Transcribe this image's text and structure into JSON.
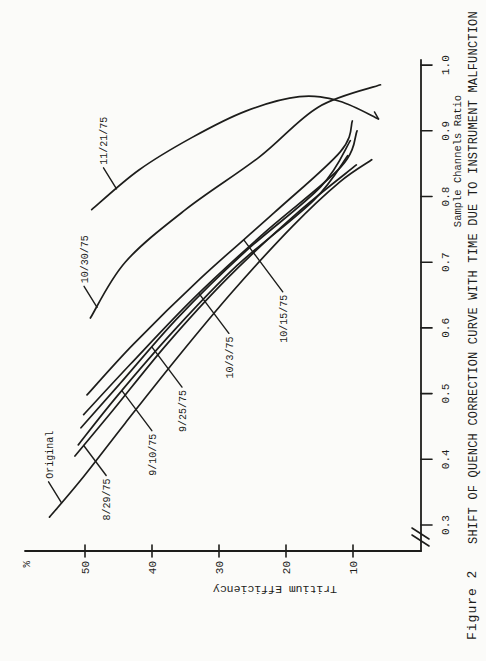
{
  "page": {
    "background": "#fbfbf9",
    "ink": "#1d1d1b"
  },
  "figure": {
    "caption": "Figure 2",
    "title": "SHIFT OF QUENCH CORRECTION CURVE WITH TIME DUE TO INSTRUMENT MALFUNCTION",
    "rotation": "chart printed landscape, rotated 90 degrees on portrait page"
  },
  "axes": {
    "x": {
      "label": "Sample Channels Ratio",
      "tick_values": [
        "0.3",
        "0.4",
        "0.5",
        "0.6",
        "0.7",
        "0.8",
        "0.9",
        "1.0"
      ],
      "range": [
        0.3,
        1.0
      ],
      "axis_break": true
    },
    "y": {
      "label": "Tritium Efficiency",
      "unit_label": "%",
      "tick_values": [
        "50",
        "40",
        "30",
        "20",
        "10"
      ],
      "range": [
        0,
        57
      ]
    }
  },
  "chart_data": {
    "type": "line",
    "title": "SHIFT OF QUENCH CORRECTION CURVE WITH TIME DUE TO INSTRUMENT MALFUNCTION",
    "xlabel": "Sample Channels Ratio",
    "ylabel": "Tritium Efficiency %",
    "xlim": [
      0.3,
      1.0
    ],
    "ylim": [
      0,
      57
    ],
    "grid": false,
    "legend": "inline leader-line labels",
    "series": [
      {
        "name": "Original",
        "side": "left",
        "attach_e": 53.5,
        "lead": 1.0,
        "points": [
          [
            0.312,
            55.3
          ],
          [
            0.37,
            50.5
          ],
          [
            0.455,
            44.0
          ],
          [
            0.555,
            36.2
          ],
          [
            0.655,
            28.0
          ],
          [
            0.755,
            19.0
          ],
          [
            0.822,
            12.0
          ],
          [
            0.856,
            7.2
          ]
        ]
      },
      {
        "name": "8/29/75",
        "side": "right",
        "attach_e": 50.2,
        "lead": 0.75,
        "points": [
          [
            0.405,
            51.5
          ],
          [
            0.475,
            45.8
          ],
          [
            0.575,
            37.8
          ],
          [
            0.675,
            28.8
          ],
          [
            0.775,
            18.3
          ],
          [
            0.848,
            9.5
          ]
        ]
      },
      {
        "name": "9/10/75",
        "side": "right",
        "attach_e": 44.5,
        "lead": 1.0,
        "points": [
          [
            0.422,
            51.0
          ],
          [
            0.495,
            45.3
          ],
          [
            0.595,
            36.8
          ],
          [
            0.695,
            27.3
          ],
          [
            0.795,
            15.8
          ],
          [
            0.862,
            10.8
          ]
        ]
      },
      {
        "name": "9/25/75",
        "side": "right",
        "attach_e": 40.0,
        "lead": 1.0,
        "points": [
          [
            0.448,
            50.6
          ],
          [
            0.515,
            44.8
          ],
          [
            0.615,
            36.2
          ],
          [
            0.715,
            26.2
          ],
          [
            0.815,
            14.8
          ],
          [
            0.885,
            10.4
          ]
        ]
      },
      {
        "name": "10/3/75",
        "side": "right",
        "attach_e": 33.0,
        "lead": 1.0,
        "points": [
          [
            0.468,
            50.2
          ],
          [
            0.545,
            43.2
          ],
          [
            0.645,
            33.8
          ],
          [
            0.745,
            23.2
          ],
          [
            0.845,
            11.8
          ],
          [
            0.9,
            9.4
          ]
        ]
      },
      {
        "name": "10/15/75",
        "side": "right",
        "attach_e": 26.3,
        "lead": 1.3,
        "points": [
          [
            0.498,
            49.7
          ],
          [
            0.575,
            42.8
          ],
          [
            0.675,
            32.8
          ],
          [
            0.775,
            21.8
          ],
          [
            0.868,
            11.9
          ],
          [
            0.915,
            10.1
          ]
        ]
      },
      {
        "name": "10/30/75",
        "side": "left",
        "attach_e": 48.2,
        "lead": 1.0,
        "points": [
          [
            0.615,
            49.2
          ],
          [
            0.7,
            44.0
          ],
          [
            0.78,
            35.0
          ],
          [
            0.86,
            24.0
          ],
          [
            0.936,
            15.2
          ],
          [
            0.97,
            5.9
          ]
        ]
      },
      {
        "name": "11/21/75",
        "side": "left",
        "attach_e": 45.3,
        "lead": 1.0,
        "end_tick": [
          7,
          -4
        ],
        "points": [
          [
            0.78,
            49.0
          ],
          [
            0.84,
            42.0
          ],
          [
            0.89,
            34.0
          ],
          [
            0.93,
            26.0
          ],
          [
            0.952,
            18.0
          ],
          [
            0.945,
            12.0
          ],
          [
            0.918,
            6.2
          ]
        ]
      }
    ]
  }
}
